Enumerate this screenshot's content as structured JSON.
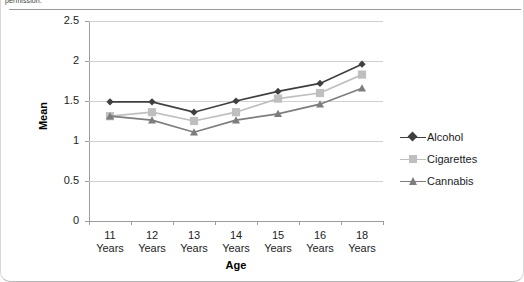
{
  "caption_fragment": "permission.",
  "chart_data": {
    "type": "line",
    "title": "",
    "xlabel": "Age",
    "ylabel": "Mean",
    "categories": [
      "11 Years",
      "12 Years",
      "13 Years",
      "14 Years",
      "15 Years",
      "16 Years",
      "18 Years"
    ],
    "category_lines": [
      [
        "11",
        "Years"
      ],
      [
        "12",
        "Years"
      ],
      [
        "13",
        "Years"
      ],
      [
        "14",
        "Years"
      ],
      [
        "15",
        "Years"
      ],
      [
        "16",
        "Years"
      ],
      [
        "18",
        "Years"
      ]
    ],
    "ylim": [
      0,
      2.5
    ],
    "yticks": [
      "0",
      "0.5",
      "1",
      "1.5",
      "2",
      "2.5"
    ],
    "ytick_values": [
      0,
      0.5,
      1,
      1.5,
      2,
      2.5
    ],
    "grid": true,
    "legend_position": "right",
    "series": [
      {
        "name": "Alcohol",
        "color": "#3f3f3f",
        "marker": "diamond",
        "values": [
          1.49,
          1.49,
          1.36,
          1.5,
          1.62,
          1.72,
          1.96
        ]
      },
      {
        "name": "Cigarettes",
        "color": "#bfbfbf",
        "marker": "square",
        "values": [
          1.31,
          1.36,
          1.25,
          1.36,
          1.53,
          1.6,
          1.83
        ]
      },
      {
        "name": "Cannabis",
        "color": "#7d7d7d",
        "marker": "triangle",
        "values": [
          1.31,
          1.26,
          1.11,
          1.26,
          1.34,
          1.46,
          1.66
        ]
      }
    ]
  }
}
